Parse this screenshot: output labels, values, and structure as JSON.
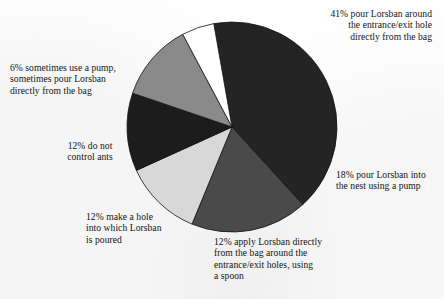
{
  "chart_data": {
    "type": "pie",
    "title": "",
    "subtitle": "",
    "xlabel": "",
    "ylabel": "",
    "legend_position": "callout-labels",
    "grid": false,
    "units": "percent",
    "total": 101,
    "geometry": {
      "center_x": 232,
      "center_y": 127,
      "radius": 105,
      "start_angle_deg": -10,
      "direction": "clockwise"
    },
    "categories": [
      "pour Lorsban around the entrance/exit hole directly from the bag",
      "pour Lorsban into the nest using a pump",
      "apply Lorsban directly from the bag around the entrance/exit holes, using a spoon",
      "make a hole into which Lorsban is poured",
      "do not control ants",
      "sometimes use a pump, sometimes pour Lorsban directly from the bag"
    ],
    "values": [
      41,
      18,
      12,
      12,
      12,
      6
    ],
    "colors": [
      "#242424",
      "#4a4a4a",
      "#d8d8d8",
      "#1c1c1c",
      "#8a8a8a",
      "#ffffff"
    ],
    "slices": [
      {
        "value": 41,
        "value_label": "41%",
        "label": "41% pour Lorsban around\nthe entrance/exit hole\ndirectly from the bag",
        "color": "#242424",
        "start_angle_deg": -10,
        "end_angle_deg": 137.6
      },
      {
        "value": 18,
        "value_label": "18%",
        "label": "18% pour Lorsban into\nthe nest using a pump",
        "color": "#4a4a4a",
        "start_angle_deg": 137.6,
        "end_angle_deg": 202.4
      },
      {
        "value": 12,
        "value_label": "12%",
        "label": "12% apply Lorsban directly\nfrom the bag around the\nentrance/exit holes, using\na spoon",
        "color": "#d8d8d8",
        "start_angle_deg": 202.4,
        "end_angle_deg": 245.6
      },
      {
        "value": 12,
        "value_label": "12%",
        "label": "12% make a hole\ninto which Lorsban\nis poured",
        "color": "#1c1c1c",
        "start_angle_deg": 245.6,
        "end_angle_deg": 288.8
      },
      {
        "value": 12,
        "value_label": "12%",
        "label": "12% do not\ncontrol ants",
        "color": "#8a8a8a",
        "start_angle_deg": 288.8,
        "end_angle_deg": 332.0
      },
      {
        "value": 6,
        "value_label": "6%",
        "label": "6% sometimes use a  pump,\nsometimes pour Lorsban\ndirectly from the bag",
        "color": "#ffffff",
        "start_angle_deg": 332.0,
        "end_angle_deg": 350.0
      }
    ]
  },
  "labels": {
    "pour_around_hole": "41% pour Lorsban around\nthe entrance/exit hole\ndirectly from the bag",
    "pour_into_nest_pump": "18% pour Lorsban into\nthe nest using a pump",
    "apply_with_spoon": "12% apply Lorsban directly\nfrom the bag around the\nentrance/exit holes, using\na spoon",
    "make_a_hole": "12% make a hole\ninto which Lorsban\nis poured",
    "do_not_control": "12% do not\ncontrol ants",
    "sometimes_pump": "6% sometimes use a  pump,\nsometimes pour Lorsban\ndirectly from the bag"
  }
}
